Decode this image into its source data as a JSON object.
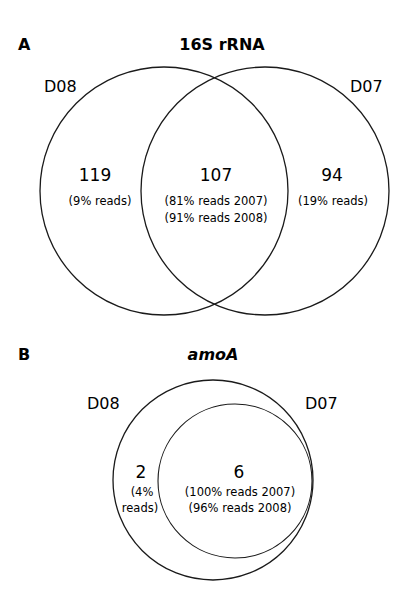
{
  "figure": {
    "panel_a": {
      "letter": "A",
      "title": "16S rRNA",
      "sets": {
        "left_label": "D08",
        "right_label": "D07"
      },
      "regions": {
        "left_only": {
          "count": "119",
          "reads": "(9% reads)"
        },
        "overlap": {
          "count": "107",
          "reads_line1": "(81% reads 2007)",
          "reads_line2": "(91% reads 2008)"
        },
        "right_only": {
          "count": "94",
          "reads": "(19% reads)"
        }
      }
    },
    "panel_b": {
      "letter": "B",
      "title": "amoA",
      "sets": {
        "outer_label": "D08",
        "inner_label": "D07"
      },
      "regions": {
        "outer_only": {
          "count": "2",
          "reads_line1": "(4%",
          "reads_line2": "reads)"
        },
        "overlap": {
          "count": "6",
          "reads_line1": "(100% reads 2007)",
          "reads_line2": "(96% reads 2008)"
        }
      }
    },
    "colors": {
      "stroke": "#1a1a1a",
      "background": "#ffffff"
    }
  }
}
